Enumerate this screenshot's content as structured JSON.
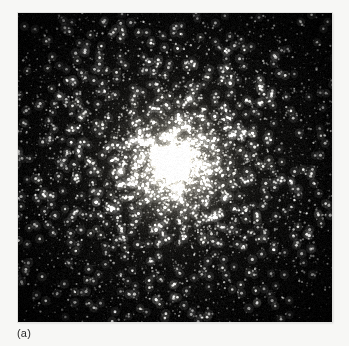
{
  "figure": {
    "caption_label": "(a)",
    "background_color": "#f7f7f5",
    "panel": {
      "name": "astronomical-photograph",
      "x": 18,
      "y": 13,
      "width": 314,
      "height": 309,
      "background_color": "#050505",
      "border_color": "#e2e2e0"
    },
    "scene": {
      "subject": "globular-cluster",
      "core": {
        "center_x_fraction": 0.5,
        "center_y_fraction": 0.49,
        "halo_radius_fraction": 0.44,
        "core_radius_fraction": 0.085,
        "core_color": "#f2efe8",
        "halo_color": "#8a8578"
      },
      "star_color": "#ffffff",
      "star_count": 9000,
      "field_seed": 20240517,
      "density_profile": "king-like radial falloff",
      "faint_field_count": 2600
    }
  }
}
